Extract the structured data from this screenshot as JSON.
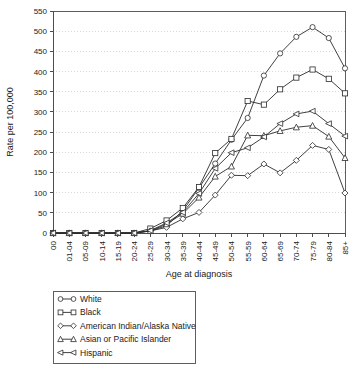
{
  "chart_data": {
    "type": "line",
    "title": "",
    "xlabel": "Age at diagnosis",
    "ylabel": "Rate per 100,000",
    "ylim": [
      0,
      550
    ],
    "ytick_step": 50,
    "yticks": [
      0,
      50,
      100,
      150,
      200,
      250,
      300,
      350,
      400,
      450,
      500,
      550
    ],
    "grid": true,
    "legend_position": "below-plot",
    "categories": [
      "00",
      "01-04",
      "05-09",
      "10-14",
      "15-19",
      "20-24",
      "25-29",
      "30-34",
      "35-39",
      "40-44",
      "45-49",
      "50-54",
      "55-59",
      "60-64",
      "65-69",
      "70-74",
      "75-79",
      "80-84",
      "85+"
    ],
    "series": [
      {
        "name": "White",
        "marker": "circle",
        "values": [
          0,
          0,
          0,
          0,
          0,
          0,
          5,
          18,
          55,
          112,
          172,
          231,
          285,
          390,
          445,
          486,
          510,
          483,
          408
        ]
      },
      {
        "name": "Black",
        "marker": "square",
        "values": [
          0,
          0,
          0,
          0,
          0,
          0,
          11,
          31,
          62,
          114,
          198,
          233,
          327,
          318,
          356,
          385,
          405,
          382,
          346
        ]
      },
      {
        "name": "American Indian/Alaska Native",
        "marker": "diamond",
        "values": [
          0,
          0,
          0,
          0,
          0,
          0,
          5,
          14,
          35,
          51,
          94,
          143,
          142,
          171,
          149,
          180,
          217,
          207,
          99
        ]
      },
      {
        "name": "Asian or Pacific Islander",
        "marker": "triangle",
        "values": [
          0,
          0,
          0,
          0,
          0,
          0,
          5,
          22,
          48,
          88,
          140,
          165,
          242,
          241,
          253,
          262,
          266,
          239,
          186
        ]
      },
      {
        "name": "Hispanic",
        "marker": "left-triangle",
        "values": [
          0,
          0,
          0,
          0,
          0,
          0,
          6,
          25,
          51,
          98,
          160,
          199,
          211,
          238,
          271,
          295,
          302,
          271,
          240
        ]
      }
    ]
  },
  "legend": {
    "items": [
      {
        "label": "White",
        "marker": "circle"
      },
      {
        "label": "Black",
        "marker": "square"
      },
      {
        "label": "American Indian/Alaska Native",
        "marker": "diamond"
      },
      {
        "label": "Asian or Pacific Islander",
        "marker": "triangle"
      },
      {
        "label": "Hispanic",
        "marker": "left-triangle"
      }
    ]
  },
  "colors": {
    "line": "#2b2b2b",
    "marker_fill": "#ffffff",
    "axis": "#4d4d4d",
    "grid": "#c9c9c9",
    "text": "#1a1a1a",
    "background": "#ffffff"
  }
}
